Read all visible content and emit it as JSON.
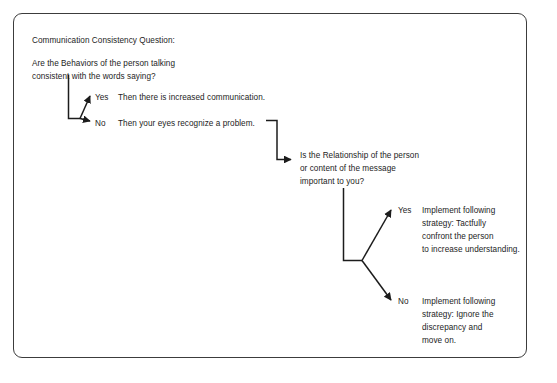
{
  "document": {
    "title_line": "Communication Consistency Question:",
    "question_one": "Are the Behaviors of the person talking\nconsistent with the words saying?",
    "question_two": "Is the Relationship of the person\nor content of the message\nimportant to you?"
  },
  "branch_one": {
    "yes": {
      "label": "Yes",
      "outcome": "Then there is increased communication."
    },
    "no": {
      "label": "No",
      "outcome": "Then your eyes recognize a problem."
    }
  },
  "branch_two": {
    "yes": {
      "label": "Yes",
      "outcome": "Implement following\nstrategy: Tactfully\nconfront the person\nto increase understanding."
    },
    "no": {
      "label": "No",
      "outcome": "Implement following\nstrategy: Ignore the\ndiscrepancy and\nmove on."
    }
  },
  "style": {
    "ink": "#1c1c1c",
    "frame": "#3c3c3c",
    "background": "#ffffff"
  }
}
